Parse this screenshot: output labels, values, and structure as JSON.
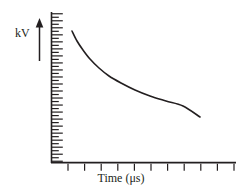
{
  "figure": {
    "kind": "line-plot",
    "background_color": "#ffffff",
    "ink_color": "#231f20"
  },
  "axes": {
    "y": {
      "label": "kV",
      "arrow_direction": "up",
      "arrow_name": "up-arrow-icon",
      "tick_style": "alternating-minor-major",
      "minor_tick_length": 7,
      "major_tick_length": 11,
      "tick_count": 43,
      "axis_top_px": 12,
      "axis_bottom_px": 163,
      "axis_x_px": 51
    },
    "x": {
      "label": "Time (μs)",
      "tick_count": 11,
      "tick_length": 7,
      "axis_left_px": 51,
      "axis_right_px": 236,
      "axis_y_px": 163,
      "first_tick_px": 68,
      "tick_spacing_px": 16.6
    }
  },
  "chart_data": {
    "type": "line",
    "title": "",
    "xlabel": "Time (μs)",
    "ylabel": "kV",
    "grid": false,
    "legend": null,
    "xlim": [
      0,
      10
    ],
    "ylim": [
      0,
      10
    ],
    "series": [
      {
        "name": "voltage-decay",
        "color": "#231f20",
        "line_width": 1.6,
        "description": "exponential decay of voltage over time",
        "x": [
          1.05,
          1.4,
          1.8,
          2.3,
          2.9,
          3.6,
          4.4,
          5.3,
          6.3,
          7.3,
          8.3,
          9.0
        ],
        "y": [
          8.75,
          7.65,
          6.65,
          5.75,
          4.95,
          4.3,
          3.75,
          3.3,
          2.95,
          2.7,
          2.5,
          2.4
        ]
      }
    ],
    "curve_points_px": [
      [
        72,
        31
      ],
      [
        77,
        41
      ],
      [
        83,
        50
      ],
      [
        90,
        59
      ],
      [
        99,
        68
      ],
      [
        109,
        76
      ],
      [
        121,
        83
      ],
      [
        135,
        90
      ],
      [
        150,
        96
      ],
      [
        166,
        101
      ],
      [
        183,
        106
      ],
      [
        200,
        117
      ]
    ]
  }
}
